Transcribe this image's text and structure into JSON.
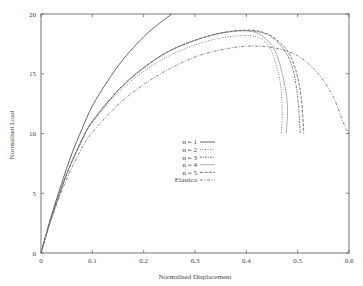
{
  "chart_data": {
    "type": "line",
    "title": "",
    "xlabel": "Normalised Displacement",
    "ylabel": "Normalised Load",
    "xlim": [
      0,
      0.6
    ],
    "ylim": [
      0,
      20
    ],
    "xticks": [
      "0",
      "0.1",
      "0.2",
      "0.3",
      "0.4",
      "0.5",
      "0.6"
    ],
    "yticks": [
      "0",
      "5",
      "10",
      "15",
      "20"
    ],
    "grid": false,
    "legend_position": "center",
    "series": [
      {
        "name": "n = 1",
        "style": "solid",
        "points": [
          [
            0,
            0
          ],
          [
            0.01,
            1.6
          ],
          [
            0.02,
            3.1
          ],
          [
            0.04,
            5.8
          ],
          [
            0.06,
            8.3
          ],
          [
            0.08,
            10.4
          ],
          [
            0.1,
            12.3
          ],
          [
            0.13,
            14.4
          ],
          [
            0.16,
            16.2
          ],
          [
            0.2,
            18.1
          ],
          [
            0.23,
            19.2
          ],
          [
            0.255,
            20
          ]
        ]
      },
      {
        "name": "n = 2",
        "style": "dotted",
        "points": [
          [
            0,
            0
          ],
          [
            0.02,
            2.9
          ],
          [
            0.05,
            6.6
          ],
          [
            0.08,
            9.4
          ],
          [
            0.1,
            10.9
          ],
          [
            0.15,
            13.4
          ],
          [
            0.2,
            15.2
          ],
          [
            0.25,
            16.5
          ],
          [
            0.3,
            17.4
          ],
          [
            0.35,
            18.0
          ],
          [
            0.4,
            18.2
          ],
          [
            0.43,
            17.9
          ],
          [
            0.45,
            16.8
          ],
          [
            0.465,
            14.5
          ],
          [
            0.47,
            12.0
          ],
          [
            0.468,
            10.0
          ]
        ]
      },
      {
        "name": "n = 3",
        "style": "dash-dot-fine",
        "points": [
          [
            0,
            0
          ],
          [
            0.02,
            2.9
          ],
          [
            0.05,
            6.6
          ],
          [
            0.08,
            9.5
          ],
          [
            0.1,
            11.0
          ],
          [
            0.15,
            13.6
          ],
          [
            0.2,
            15.5
          ],
          [
            0.25,
            16.9
          ],
          [
            0.3,
            17.8
          ],
          [
            0.35,
            18.4
          ],
          [
            0.4,
            18.6
          ],
          [
            0.44,
            18.3
          ],
          [
            0.47,
            17.2
          ],
          [
            0.49,
            15.5
          ],
          [
            0.5,
            13.0
          ],
          [
            0.505,
            10.0
          ]
        ]
      },
      {
        "name": "n = 4",
        "style": "solid-light",
        "points": [
          [
            0,
            0
          ],
          [
            0.02,
            2.9
          ],
          [
            0.05,
            6.6
          ],
          [
            0.08,
            9.5
          ],
          [
            0.1,
            11.0
          ],
          [
            0.15,
            13.6
          ],
          [
            0.2,
            15.5
          ],
          [
            0.25,
            16.9
          ],
          [
            0.3,
            17.8
          ],
          [
            0.35,
            18.4
          ],
          [
            0.4,
            18.6
          ],
          [
            0.43,
            18.2
          ],
          [
            0.455,
            17.0
          ],
          [
            0.47,
            15.0
          ],
          [
            0.48,
            12.5
          ],
          [
            0.478,
            10.0
          ]
        ]
      },
      {
        "name": "n = 5",
        "style": "dashed",
        "points": [
          [
            0,
            0
          ],
          [
            0.02,
            2.9
          ],
          [
            0.05,
            6.6
          ],
          [
            0.08,
            9.5
          ],
          [
            0.1,
            11.0
          ],
          [
            0.15,
            13.6
          ],
          [
            0.2,
            15.5
          ],
          [
            0.25,
            16.9
          ],
          [
            0.3,
            17.8
          ],
          [
            0.35,
            18.4
          ],
          [
            0.4,
            18.65
          ],
          [
            0.44,
            18.35
          ],
          [
            0.475,
            17.2
          ],
          [
            0.495,
            15.5
          ],
          [
            0.507,
            13.0
          ],
          [
            0.512,
            10.0
          ]
        ]
      },
      {
        "name": "Elastica",
        "style": "dash-dot",
        "points": [
          [
            0,
            0
          ],
          [
            0.02,
            2.8
          ],
          [
            0.05,
            6.2
          ],
          [
            0.08,
            8.8
          ],
          [
            0.1,
            10.1
          ],
          [
            0.15,
            12.4
          ],
          [
            0.2,
            14.1
          ],
          [
            0.25,
            15.4
          ],
          [
            0.3,
            16.4
          ],
          [
            0.35,
            17.0
          ],
          [
            0.4,
            17.3
          ],
          [
            0.45,
            17.2
          ],
          [
            0.5,
            16.5
          ],
          [
            0.54,
            15.0
          ],
          [
            0.57,
            13.0
          ],
          [
            0.59,
            10.8
          ],
          [
            0.6,
            10.0
          ]
        ]
      }
    ]
  }
}
